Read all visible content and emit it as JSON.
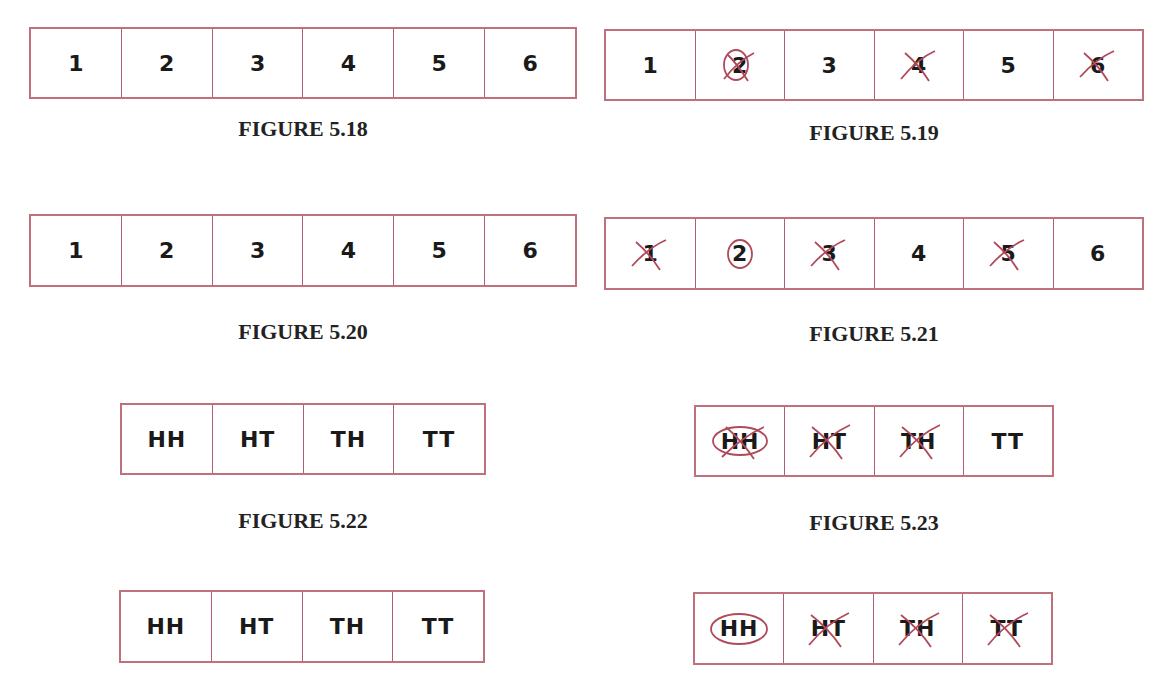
{
  "colors": {
    "border": "#c0707a",
    "ink": "#1a1a1a",
    "annotation": "#b04a5a"
  },
  "figures": [
    {
      "id": "fig518",
      "caption": "FIGURE 5.18",
      "cells": [
        {
          "label": "1",
          "mark": "none"
        },
        {
          "label": "2",
          "mark": "none"
        },
        {
          "label": "3",
          "mark": "none"
        },
        {
          "label": "4",
          "mark": "none"
        },
        {
          "label": "5",
          "mark": "none"
        },
        {
          "label": "6",
          "mark": "none"
        }
      ]
    },
    {
      "id": "fig519",
      "caption": "FIGURE 5.19",
      "cells": [
        {
          "label": "1",
          "mark": "none"
        },
        {
          "label": "2",
          "mark": "circled-crossed"
        },
        {
          "label": "3",
          "mark": "none"
        },
        {
          "label": "4",
          "mark": "crossed"
        },
        {
          "label": "5",
          "mark": "none"
        },
        {
          "label": "6",
          "mark": "crossed"
        }
      ]
    },
    {
      "id": "fig520",
      "caption": "FIGURE 5.20",
      "cells": [
        {
          "label": "1",
          "mark": "none"
        },
        {
          "label": "2",
          "mark": "none"
        },
        {
          "label": "3",
          "mark": "none"
        },
        {
          "label": "4",
          "mark": "none"
        },
        {
          "label": "5",
          "mark": "none"
        },
        {
          "label": "6",
          "mark": "none"
        }
      ]
    },
    {
      "id": "fig521",
      "caption": "FIGURE 5.21",
      "cells": [
        {
          "label": "1",
          "mark": "crossed"
        },
        {
          "label": "2",
          "mark": "circled"
        },
        {
          "label": "3",
          "mark": "crossed"
        },
        {
          "label": "4",
          "mark": "none"
        },
        {
          "label": "5",
          "mark": "crossed"
        },
        {
          "label": "6",
          "mark": "none"
        }
      ]
    },
    {
      "id": "fig522",
      "caption": "FIGURE 5.22",
      "cells": [
        {
          "label": "HH",
          "mark": "none"
        },
        {
          "label": "HT",
          "mark": "none"
        },
        {
          "label": "TH",
          "mark": "none"
        },
        {
          "label": "TT",
          "mark": "none"
        }
      ]
    },
    {
      "id": "fig523",
      "caption": "FIGURE 5.23",
      "cells": [
        {
          "label": "HH",
          "mark": "circled-crossed"
        },
        {
          "label": "HT",
          "mark": "crossed"
        },
        {
          "label": "TH",
          "mark": "crossed"
        },
        {
          "label": "TT",
          "mark": "none"
        }
      ]
    },
    {
      "id": "fig524",
      "caption": "",
      "cells": [
        {
          "label": "HH",
          "mark": "none"
        },
        {
          "label": "HT",
          "mark": "none"
        },
        {
          "label": "TH",
          "mark": "none"
        },
        {
          "label": "TT",
          "mark": "none"
        }
      ]
    },
    {
      "id": "fig525",
      "caption": "",
      "cells": [
        {
          "label": "HH",
          "mark": "circled"
        },
        {
          "label": "HT",
          "mark": "crossed"
        },
        {
          "label": "TH",
          "mark": "crossed"
        },
        {
          "label": "TT",
          "mark": "crossed"
        }
      ]
    }
  ]
}
